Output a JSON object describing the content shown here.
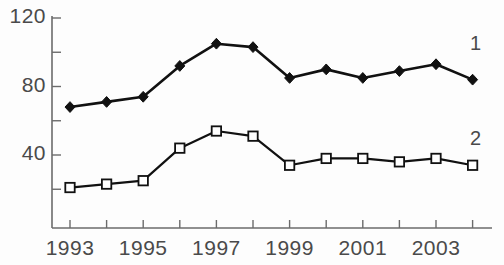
{
  "chart_data": {
    "type": "line",
    "title": "",
    "xlabel": "",
    "ylabel": "",
    "grid": false,
    "legend_position": "right-inline",
    "x": [
      1993,
      1994,
      1995,
      1996,
      1997,
      1998,
      1999,
      2000,
      2001,
      2002,
      2003,
      2004
    ],
    "xtick_labels": [
      "1993",
      "1995",
      "1997",
      "1999",
      "2001",
      "2003"
    ],
    "xtick_values": [
      1993,
      1995,
      1997,
      1999,
      2001,
      2003
    ],
    "xlim": [
      1992.5,
      2004.5
    ],
    "ytick_labels": [
      "120",
      "80",
      "40"
    ],
    "ytick_values": [
      120,
      80,
      40
    ],
    "yminor_values": [
      100,
      60,
      20
    ],
    "ylim": [
      12,
      128
    ],
    "series": [
      {
        "name": "1",
        "marker": "filled-diamond",
        "color": "#111111",
        "values": [
          68,
          71,
          74,
          92,
          105,
          103,
          85,
          90,
          85,
          89,
          93,
          84
        ]
      },
      {
        "name": "2",
        "marker": "open-square",
        "color": "#111111",
        "values": [
          21,
          23,
          25,
          44,
          54,
          51,
          34,
          38,
          38,
          36,
          38,
          34
        ]
      }
    ]
  },
  "axis": {
    "y_labels": [
      {
        "text": "120",
        "value": 120
      },
      {
        "text": "80",
        "value": 80
      },
      {
        "text": "40",
        "value": 40
      }
    ],
    "x_labels": [
      {
        "text": "1993",
        "value": 1993
      },
      {
        "text": "1995",
        "value": 1995
      },
      {
        "text": "1997",
        "value": 1997
      },
      {
        "text": "1999",
        "value": 1999
      },
      {
        "text": "2001",
        "value": 2001
      },
      {
        "text": "2003",
        "value": 2003
      }
    ],
    "axis_color": "#6b6b6b"
  },
  "series_labels": [
    {
      "text": "1",
      "x": 470,
      "y": 45
    },
    {
      "text": "2",
      "x": 470,
      "y": 140
    }
  ]
}
